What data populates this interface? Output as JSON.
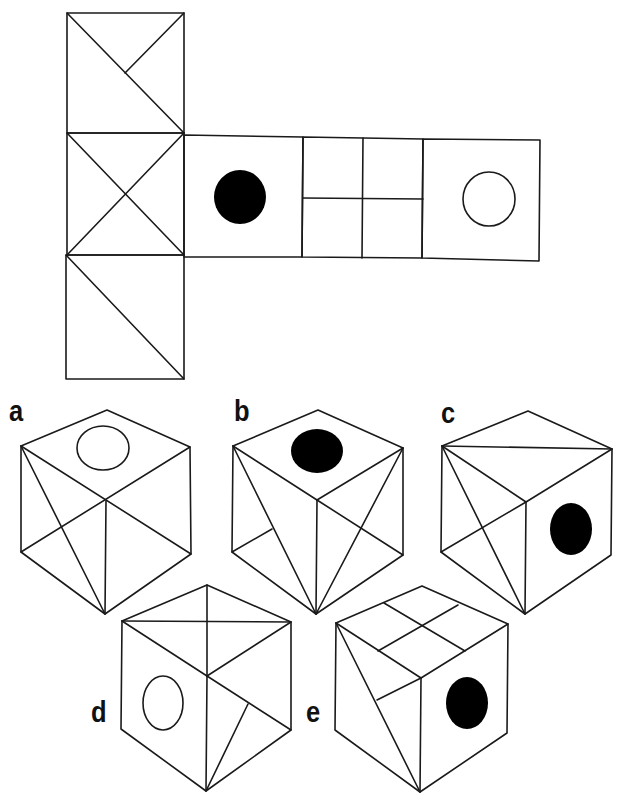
{
  "puzzle": {
    "type": "cube-net-folding",
    "net": {
      "faces": [
        {
          "id": "column-top",
          "pattern": "diagonal-plus-half-diagonal"
        },
        {
          "id": "column-middle",
          "pattern": "x-cross"
        },
        {
          "id": "column-bottom",
          "pattern": "single-diagonal"
        },
        {
          "id": "row-1",
          "pattern": "black-circle"
        },
        {
          "id": "row-2",
          "pattern": "2x2-grid"
        },
        {
          "id": "row-3",
          "pattern": "white-circle"
        }
      ]
    },
    "options": [
      {
        "id": "a",
        "label": "a"
      },
      {
        "id": "b",
        "label": "b"
      },
      {
        "id": "c",
        "label": "c"
      },
      {
        "id": "d",
        "label": "d"
      },
      {
        "id": "e",
        "label": "e"
      }
    ]
  },
  "colors": {
    "line": "#1a1a1a",
    "filled_circle": "#000000",
    "background": "#ffffff"
  }
}
